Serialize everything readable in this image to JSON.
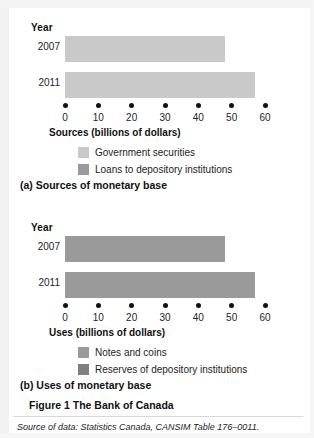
{
  "figure": {
    "caption": "Figure 1  The Bank of Canada",
    "source_note": "Source of data: Statistics Canada, CANSIM Table 176–0011."
  },
  "colors": {
    "light_gray": "#c9c9c9",
    "mid_gray": "#9a9a9a",
    "dark_gray": "#7f7f7f",
    "axis_dot": "#111111",
    "text": "#1d1d1d",
    "page_background": "#ffffff"
  },
  "panel_a": {
    "caption": "(a) Sources of monetary base",
    "year_header": "Year",
    "legend": [
      {
        "label": "Government securities",
        "color": "#c9c9c9"
      },
      {
        "label": "Loans to depository institutions",
        "color": "#9a9a9a"
      }
    ]
  },
  "panel_b": {
    "caption": "(b) Uses of monetary base",
    "year_header": "Year",
    "legend": [
      {
        "label": "Notes and coins",
        "color": "#9a9a9a"
      },
      {
        "label": "Reserves of depository institutions",
        "color": "#7f7f7f"
      }
    ]
  },
  "chart_data": [
    {
      "type": "bar",
      "orientation": "horizontal",
      "title": "(a) Sources of monetary base",
      "xlabel": "Sources (billions of dollars)",
      "ylabel": "Year",
      "categories": [
        "2007",
        "2011"
      ],
      "values": [
        48,
        57
      ],
      "series": [
        {
          "name": "Government securities",
          "values": [
            48,
            57
          ],
          "color": "#c9c9c9"
        }
      ],
      "legend_entries": [
        "Government securities",
        "Loans to depository institutions"
      ],
      "legend_position": "below-axis",
      "xlim": [
        0,
        60
      ],
      "xticks": [
        0,
        10,
        20,
        30,
        40,
        50,
        60
      ],
      "xticklabels": [
        "0",
        "10",
        "20",
        "30",
        "40",
        "50",
        "60"
      ],
      "grid": false,
      "tick_marker_style": "dot"
    },
    {
      "type": "bar",
      "orientation": "horizontal",
      "title": "(b) Uses of monetary base",
      "xlabel": "Uses (billions of dollars)",
      "ylabel": "Year",
      "categories": [
        "2007",
        "2011"
      ],
      "values": [
        48,
        57
      ],
      "series": [
        {
          "name": "Notes and coins",
          "values": [
            48,
            57
          ],
          "color": "#9a9a9a"
        }
      ],
      "legend_entries": [
        "Notes and coins",
        "Reserves of depository institutions"
      ],
      "legend_position": "below-axis",
      "xlim": [
        0,
        60
      ],
      "xticks": [
        0,
        10,
        20,
        30,
        40,
        50,
        60
      ],
      "xticklabels": [
        "0",
        "10",
        "20",
        "30",
        "40",
        "50",
        "60"
      ],
      "grid": false,
      "tick_marker_style": "dot"
    }
  ]
}
